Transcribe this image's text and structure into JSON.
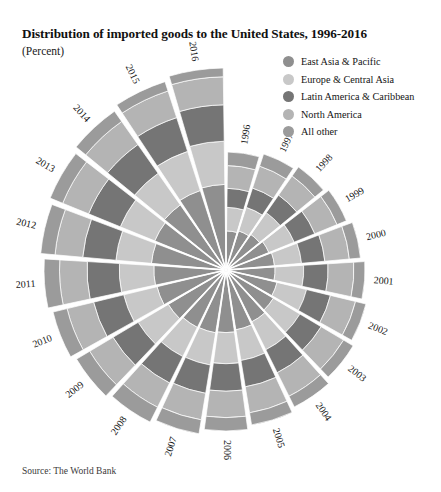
{
  "header": {
    "title": "Distribution of imported goods to the United States, 1996-2016",
    "subtitle": "(Percent)",
    "source": "Source: The World Bank"
  },
  "legend": {
    "position": "top-right",
    "items": [
      {
        "label": "East Asia & Pacific",
        "color": "#8f8f8f"
      },
      {
        "label": "Europe & Central Asia",
        "color": "#c8c8c8"
      },
      {
        "label": "Latin America & Caribbean",
        "color": "#757575"
      },
      {
        "label": "North America",
        "color": "#b4b4b4"
      },
      {
        "label": "All other",
        "color": "#9b9b9b"
      }
    ]
  },
  "chart_data": {
    "type": "area",
    "variant": "polar-stacked-radial",
    "title": "Distribution of imported goods to the United States, 1996-2016",
    "subtitle": "(Percent)",
    "xlabel": "",
    "ylabel": "Percent",
    "ylim": [
      0,
      100
    ],
    "grid": false,
    "legend_position": "top-right",
    "start_angle_deg": 0,
    "direction": "clockwise",
    "wedge_gap_deg": 1.6,
    "categories": [
      "1996",
      "1997",
      "1998",
      "1999",
      "2000",
      "2001",
      "2002",
      "2003",
      "2004",
      "2005",
      "2006",
      "2007",
      "2008",
      "2009",
      "2010",
      "2011",
      "2012",
      "2013",
      "2014",
      "2015",
      "2016"
    ],
    "series": [
      {
        "name": "East Asia & Pacific",
        "color": "#8f8f8f",
        "values": [
          32.0,
          32.6,
          33.4,
          34.6,
          35.1,
          34.4,
          35.6,
          36.4,
          37.0,
          37.8,
          38.1,
          37.6,
          37.0,
          37.9,
          39.2,
          39.0,
          39.6,
          39.9,
          40.4,
          41.6,
          41.8
        ]
      },
      {
        "name": "Europe & Central Asia",
        "color": "#c8c8c8",
        "values": [
          20.3,
          20.6,
          21.5,
          21.4,
          20.4,
          20.9,
          21.4,
          21.2,
          20.7,
          20.1,
          19.6,
          19.9,
          19.4,
          20.4,
          19.5,
          19.2,
          19.4,
          19.8,
          20.1,
          21.0,
          21.6
        ]
      },
      {
        "name": "Latin America & Caribbean",
        "color": "#757575",
        "values": [
          16.4,
          16.9,
          17.3,
          17.4,
          17.6,
          17.8,
          17.3,
          16.9,
          17.0,
          17.2,
          17.3,
          17.5,
          17.6,
          17.0,
          17.6,
          17.9,
          18.1,
          18.2,
          18.3,
          18.1,
          18.2
        ]
      },
      {
        "name": "North America",
        "color": "#b4b4b4",
        "values": [
          19.6,
          19.2,
          18.9,
          18.8,
          18.5,
          18.8,
          18.2,
          17.9,
          17.4,
          17.0,
          16.6,
          16.4,
          16.1,
          15.8,
          15.5,
          15.3,
          15.1,
          14.9,
          14.7,
          14.3,
          14.0
        ]
      },
      {
        "name": "All other",
        "color": "#9b9b9b",
        "values": [
          11.7,
          10.7,
          8.9,
          7.8,
          8.4,
          8.1,
          7.5,
          7.6,
          7.9,
          7.9,
          8.4,
          8.6,
          9.9,
          8.9,
          8.2,
          8.6,
          7.8,
          7.2,
          6.5,
          5.0,
          4.4
        ]
      }
    ],
    "wedge_radius": [
      118,
      122,
      126,
      130,
      135,
      139,
      144,
      148,
      153,
      157,
      161,
      166,
      170,
      174,
      178,
      182,
      186,
      190,
      194,
      198,
      202
    ],
    "inner_radius": 2,
    "annotations": []
  }
}
